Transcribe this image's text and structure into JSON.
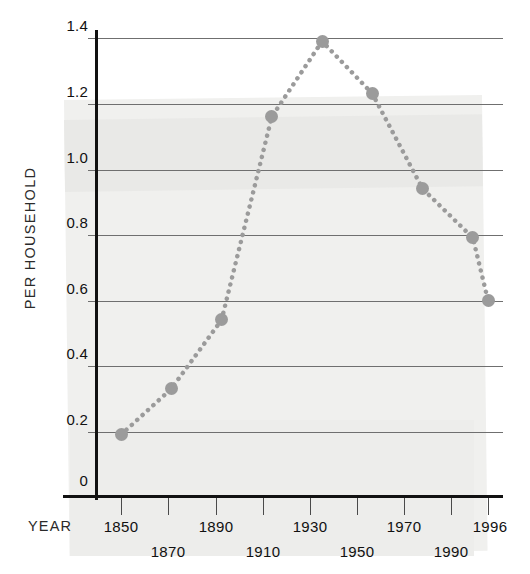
{
  "chart_data": {
    "type": "line",
    "title": "",
    "subtitle": "",
    "xlabel": "YEAR",
    "ylabel": "PER HOUSEHOLD",
    "x": [
      1850,
      1870,
      1890,
      1910,
      1930,
      1950,
      1970,
      1990,
      1996
    ],
    "values": [
      0.19,
      0.33,
      0.54,
      1.16,
      1.39,
      1.23,
      0.94,
      0.79,
      0.6
    ],
    "series": [
      {
        "name": "Per household",
        "values": [
          0.19,
          0.33,
          0.54,
          1.16,
          1.39,
          1.23,
          0.94,
          0.79,
          0.6
        ]
      }
    ],
    "xlim": [
      1844,
      1999
    ],
    "ylim": [
      0,
      1.4
    ],
    "ytick_labels": [
      "1.4",
      "1.2",
      "1.0",
      "0.8",
      "0.6",
      "0.4",
      "0.2",
      "0"
    ],
    "ytick_values": [
      1.4,
      1.2,
      1.0,
      0.8,
      0.6,
      0.4,
      0.2,
      0
    ],
    "xtick_labels": [
      "1850",
      "1870",
      "1890",
      "1910",
      "1930",
      "1950",
      "1970",
      "1990",
      "1996"
    ],
    "grid": "horizontal",
    "legend": "none",
    "line_style": "dotted",
    "marker": "circle",
    "series_color": "#9b9b9b",
    "grid_color": "#6f6f6f",
    "axis_color": "#111111",
    "background_color": "#ffffff",
    "paper_shade_color": "#f0f0ee"
  },
  "axis": {
    "y_title": "PER HOUSEHOLD",
    "x_title": "YEAR"
  },
  "yticks": [
    {
      "label": "1.4"
    },
    {
      "label": "1.2"
    },
    {
      "label": "1.0"
    },
    {
      "label": "0.8"
    },
    {
      "label": "0.6"
    },
    {
      "label": "0.4"
    },
    {
      "label": "0.2"
    },
    {
      "label": "0"
    }
  ],
  "xticks": [
    {
      "label": "1850"
    },
    {
      "label": "1870"
    },
    {
      "label": "1890"
    },
    {
      "label": "1910"
    },
    {
      "label": "1930"
    },
    {
      "label": "1950"
    },
    {
      "label": "1970"
    },
    {
      "label": "1990"
    },
    {
      "label": "1996"
    }
  ]
}
